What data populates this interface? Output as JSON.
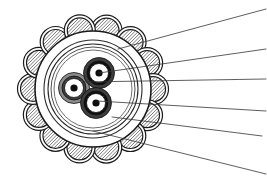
{
  "figure": {
    "width": 267,
    "height": 181,
    "background_color": "#ffffff",
    "line_color": "#1a1a1a"
  },
  "diagram": {
    "type": "cross-section",
    "center": {
      "x": 93,
      "y": 89
    },
    "layers": [
      {
        "id": "outer-sheath",
        "name": "outer-sheath",
        "shape": "circle",
        "cx": 93,
        "cy": 89,
        "r": 58,
        "stroke": "#1a1a1a",
        "stroke_width": 1.6,
        "fill": "none"
      },
      {
        "id": "bedding-ring",
        "name": "bedding-ring",
        "shape": "circle",
        "cx": 93,
        "cy": 89,
        "r": 49,
        "stroke": "#2b2b2b",
        "stroke_width": 1.1,
        "fill": "none"
      },
      {
        "id": "inner-sheath",
        "name": "inner-sheath",
        "shape": "circle",
        "cx": 93,
        "cy": 89,
        "r": 45,
        "stroke": "#2b2b2b",
        "stroke_width": 1.1,
        "fill": "none"
      },
      {
        "id": "screen-tape",
        "name": "screen-tape",
        "shape": "circle",
        "cx": 93,
        "cy": 89,
        "r": 42,
        "stroke": "#3a3a3a",
        "stroke_width": 0.9,
        "fill": "none"
      },
      {
        "id": "filler-boundary",
        "name": "filler-boundary",
        "shape": "circle",
        "cx": 93,
        "cy": 89,
        "r": 39,
        "stroke": "#4a4a4a",
        "stroke_width": 0.8,
        "fill": "none"
      }
    ],
    "armour": {
      "name": "steel-wire-armour",
      "count": 14,
      "ring_radius": 60,
      "wire_outer_radius": 15.5,
      "wire_inner_radius": 12.5,
      "start_angle_deg": -77,
      "stroke": "#1a1a1a",
      "stroke_width": 1.2,
      "hatch": {
        "angle_deg": 45,
        "spacing": 3.4,
        "stroke": "#404040",
        "stroke_width": 0.7
      }
    },
    "conductors": [
      {
        "id": "conductor-left",
        "name": "conductor-left",
        "cx": 74,
        "cy": 88,
        "insulation_r": 15.5,
        "insulation_color": "#8c8c8c",
        "screen_r": 12.0,
        "screen_color": "#3d3d3d",
        "core_white_r": 9.5,
        "core_white_color": "#ffffff",
        "core_r": 3.6,
        "core_color": "#0d0d0d"
      },
      {
        "id": "conductor-top-right",
        "name": "conductor-top-right",
        "cx": 99,
        "cy": 73,
        "insulation_r": 15.5,
        "insulation_color": "#3d3d3d",
        "screen_r": 12.0,
        "screen_color": "#101010",
        "core_white_r": 9.5,
        "core_white_color": "#ffffff",
        "core_r": 3.6,
        "core_color": "#0d0d0d"
      },
      {
        "id": "conductor-bottom",
        "name": "conductor-bottom",
        "cx": 96,
        "cy": 103,
        "insulation_r": 15.5,
        "insulation_color": "#3d3d3d",
        "screen_r": 12.0,
        "screen_color": "#101010",
        "core_white_r": 9.5,
        "core_white_color": "#ffffff",
        "core_r": 3.6,
        "core_color": "#0d0d0d"
      }
    ],
    "leader_lines": [
      {
        "id": "leader-1",
        "name": "leader-line-1",
        "from": {
          "x": 118,
          "y": 49
        },
        "to": {
          "x": 266,
          "y": 9
        },
        "stroke": "#353535",
        "stroke_width": 0.8
      },
      {
        "id": "leader-2",
        "name": "leader-line-2",
        "from": {
          "x": 99,
          "y": 73
        },
        "to": {
          "x": 266,
          "y": 49
        },
        "stroke": "#353535",
        "stroke_width": 0.8
      },
      {
        "id": "leader-3",
        "name": "leader-line-3",
        "from": {
          "x": 84,
          "y": 82
        },
        "to": {
          "x": 266,
          "y": 79
        },
        "stroke": "#353535",
        "stroke_width": 0.8
      },
      {
        "id": "leader-4",
        "name": "leader-line-4",
        "from": {
          "x": 97,
          "y": 101
        },
        "to": {
          "x": 266,
          "y": 111
        },
        "stroke": "#353535",
        "stroke_width": 0.8
      },
      {
        "id": "leader-5",
        "name": "leader-line-5",
        "from": {
          "x": 112,
          "y": 117
        },
        "to": {
          "x": 262,
          "y": 136
        },
        "stroke": "#353535",
        "stroke_width": 0.8
      },
      {
        "id": "leader-6",
        "name": "leader-line-6",
        "from": {
          "x": 93,
          "y": 131
        },
        "to": {
          "x": 266,
          "y": 174
        },
        "stroke": "#353535",
        "stroke_width": 0.8
      }
    ]
  }
}
